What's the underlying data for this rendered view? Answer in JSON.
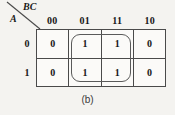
{
  "figure": {
    "type": "karnaugh-map",
    "caption": "(b)",
    "row_variable_label": "A",
    "column_variable_label": "BC"
  },
  "kmap": {
    "column_headers": [
      "00",
      "01",
      "11",
      "10"
    ],
    "row_headers": [
      "0",
      "1"
    ],
    "cells": [
      [
        "0",
        "1",
        "1",
        "0"
      ],
      [
        "0",
        "1",
        "1",
        "0"
      ]
    ],
    "groups": [
      {
        "name": "group-ones",
        "columns": [
          "01",
          "11"
        ],
        "rows": [
          "0",
          "1"
        ],
        "cell_values": [
          "1",
          "1",
          "1",
          "1"
        ]
      }
    ]
  },
  "colors": {
    "background": "#f4f3f0",
    "cell_background": "#fbfaf8",
    "grid_line": "#4a4a4a",
    "text": "#161616",
    "group_outline": "#5a5a5a",
    "caption_text": "#3a3a3a"
  }
}
